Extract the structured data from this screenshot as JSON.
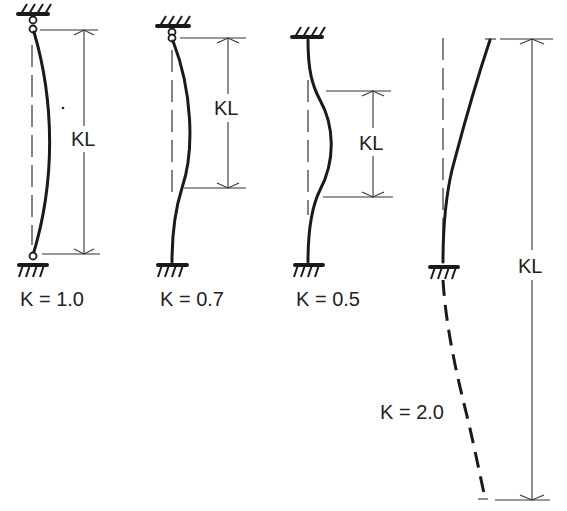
{
  "diagram": {
    "dimension_label": "KL",
    "columns": [
      {
        "id": "pinned-pinned",
        "label": "K = 1.0",
        "dim_label": "KL"
      },
      {
        "id": "pinned-fixed",
        "label": "K = 0.7",
        "dim_label": "KL"
      },
      {
        "id": "fixed-fixed",
        "label": "K = 0.5",
        "dim_label": "KL"
      },
      {
        "id": "fixed-free",
        "label": "K = 2.0",
        "dim_label": "KL"
      }
    ]
  },
  "colors": {
    "ink": "#1a1a1a",
    "background": "#ffffff"
  }
}
